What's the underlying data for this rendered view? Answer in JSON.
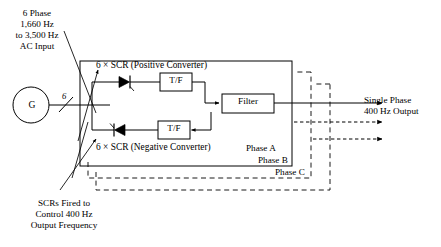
{
  "figure": {
    "type": "block-diagram",
    "title_visible": false,
    "background_color": "#ffffff",
    "line_color": "#000000"
  },
  "input": {
    "label_lines": [
      "6 Phase",
      "1,660 Hz",
      "to 3,500 Hz",
      "AC Input"
    ],
    "label_text": "6 Phase\n1,660 Hz\nto 3,500 Hz\nAC Input",
    "generator_symbol": "G",
    "bus_count": "6"
  },
  "converters": {
    "positive_label": "6 × SCR (Positive Converter)",
    "negative_label": "6 × SCR (Negative Converter)",
    "positive_icon": "scr-thyristor-forward-icon",
    "negative_icon": "scr-thyristor-reverse-icon"
  },
  "blocks": {
    "transformer_top": "T/F",
    "transformer_bottom": "T/F",
    "filter": "Filter"
  },
  "phases": {
    "a": "Phase A",
    "b": "Phase B",
    "c": "Phase C"
  },
  "output": {
    "label_lines": [
      "Single Phase",
      "400 Hz Output"
    ],
    "label_text": "Single Phase\n400 Hz Output",
    "arrow_count": 3
  },
  "annotation": {
    "scr_note_lines": [
      "SCRs Fired to",
      "Control 400 Hz",
      "Output Frequency"
    ],
    "scr_note_text": "SCRs Fired to\nControl 400 Hz\nOutput Frequency"
  }
}
